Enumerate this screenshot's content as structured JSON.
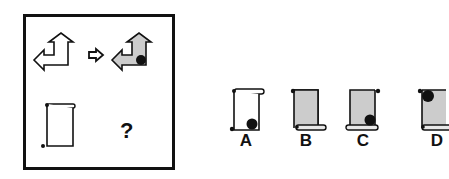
{
  "puzzle": {
    "type": "visual-analogy",
    "transform_symbol": "⇨",
    "unknown_symbol": "?",
    "source_pair": {
      "from": {
        "shape": "double-arrow-up-left",
        "fill": "#ffffff",
        "dot": false
      },
      "to": {
        "shape": "double-arrow-up-left",
        "fill": "#cccccc",
        "dot": true,
        "dot_position": "bottom-right-corner"
      }
    },
    "query": {
      "shape": "scroll",
      "fill": "#ffffff",
      "dot": false
    }
  },
  "options": [
    {
      "label": "A",
      "fill": "#ffffff",
      "dot": true,
      "dot_position": "bottom-right",
      "roll": "top"
    },
    {
      "label": "B",
      "fill": "#cccccc",
      "dot": false,
      "roll": "bottom"
    },
    {
      "label": "C",
      "fill": "#cccccc",
      "dot": true,
      "dot_position": "bottom-right",
      "roll": "bottom"
    },
    {
      "label": "D",
      "fill": "#cccccc",
      "dot": true,
      "dot_position": "top-left",
      "roll": "bottom"
    }
  ],
  "colors": {
    "stroke": "#111111",
    "shade": "#cccccc",
    "dot": "#111111"
  }
}
